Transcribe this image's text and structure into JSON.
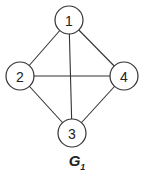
{
  "graph": {
    "name": "G",
    "subscript": "1",
    "nodes": [
      {
        "id": "1",
        "label": "1"
      },
      {
        "id": "2",
        "label": "2"
      },
      {
        "id": "3",
        "label": "3"
      },
      {
        "id": "4",
        "label": "4"
      }
    ],
    "edges": [
      [
        "1",
        "2"
      ],
      [
        "1",
        "4"
      ],
      [
        "1",
        "3"
      ],
      [
        "2",
        "4"
      ],
      [
        "2",
        "3"
      ],
      [
        "4",
        "3"
      ]
    ]
  },
  "colors": {
    "stroke": "#333333",
    "text": "#222222",
    "background": "#ffffff"
  }
}
